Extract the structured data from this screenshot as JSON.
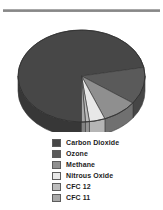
{
  "chart_data": {
    "type": "pie",
    "title": "",
    "subtitle": "",
    "xlabel": "",
    "ylabel": "",
    "grid": false,
    "legend_position": "bottom",
    "three_d": true,
    "categories": [
      "Carbon Dioxide",
      "Ozone",
      "Methane",
      "Nitrous Oxide",
      "CFC 12",
      "CFC 11"
    ],
    "values": [
      72,
      13,
      9,
      4,
      1,
      1
    ],
    "colors": [
      "#474747",
      "#5a5a5a",
      "#8f8f8f",
      "#e8e8e8",
      "#bdbdbd",
      "#a8a8a8"
    ],
    "slices": [
      {
        "label": "Carbon Dioxide",
        "value": 72,
        "color": "#474747"
      },
      {
        "label": "Ozone",
        "value": 13,
        "color": "#5a5a5a"
      },
      {
        "label": "Methane",
        "value": 9,
        "color": "#8f8f8f"
      },
      {
        "label": "Nitrous Oxide",
        "value": 4,
        "color": "#e8e8e8"
      },
      {
        "label": "CFC 12",
        "value": 1,
        "color": "#bdbdbd"
      },
      {
        "label": "CFC 11",
        "value": 1,
        "color": "#a8a8a8"
      }
    ]
  },
  "legend": {
    "items": [
      {
        "label": "Carbon Dioxide",
        "color": "#474747"
      },
      {
        "label": "Ozone",
        "color": "#5a5a5a"
      },
      {
        "label": "Methane",
        "color": "#8f8f8f"
      },
      {
        "label": "Nitrous Oxide",
        "color": "#e8e8e8"
      },
      {
        "label": "CFC 12",
        "color": "#bdbdbd"
      },
      {
        "label": "CFC 11",
        "color": "#a8a8a8"
      }
    ]
  },
  "divider": {
    "color": "#8c8c8c"
  }
}
